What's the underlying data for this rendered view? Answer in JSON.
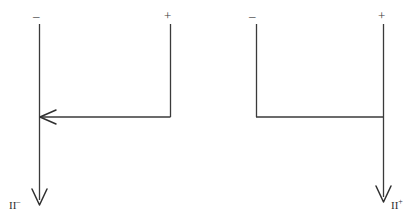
{
  "figure": {
    "background_color": "#ffffff",
    "line_color": "#3a3a3a",
    "width": 416,
    "height": 224,
    "clipped_top_text": "and the direction of the current"
  },
  "left_circuit": {
    "name": "negative-current-circuit",
    "terminal_minus_label": "–",
    "terminal_plus_label": "+",
    "current_label_text": "II",
    "current_label_sign": "–",
    "arrow_direction": "left",
    "description": "horizontal arrow pointing left and vertical arrow pointing down"
  },
  "right_circuit": {
    "name": "positive-current-circuit",
    "terminal_minus_label": "–",
    "terminal_plus_label": "+",
    "current_label_text": "II",
    "current_label_sign": "+",
    "arrow_direction": "down",
    "description": "plain horizontal connector and vertical arrow pointing down"
  }
}
